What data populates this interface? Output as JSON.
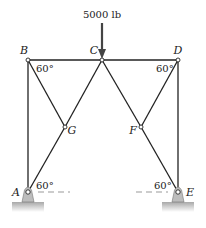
{
  "diagram": {
    "type": "truss",
    "load": {
      "label": "5000 lb",
      "node": "C",
      "direction": "down"
    },
    "nodes": [
      {
        "id": "A",
        "label": "A",
        "x": 28,
        "y": 192,
        "support": "pin"
      },
      {
        "id": "B",
        "label": "B",
        "x": 28,
        "y": 60
      },
      {
        "id": "C",
        "label": "C",
        "x": 102,
        "y": 60
      },
      {
        "id": "D",
        "label": "D",
        "x": 178,
        "y": 60
      },
      {
        "id": "E",
        "label": "E",
        "x": 178,
        "y": 192,
        "support": "pin"
      },
      {
        "id": "F",
        "label": "F",
        "x": 141,
        "y": 127
      },
      {
        "id": "G",
        "label": "G",
        "x": 65,
        "y": 127
      }
    ],
    "members": [
      [
        "A",
        "B"
      ],
      [
        "B",
        "C"
      ],
      [
        "C",
        "D"
      ],
      [
        "D",
        "E"
      ],
      [
        "B",
        "G"
      ],
      [
        "G",
        "C"
      ],
      [
        "A",
        "G"
      ],
      [
        "C",
        "F"
      ],
      [
        "F",
        "D"
      ],
      [
        "F",
        "E"
      ]
    ],
    "angles": [
      {
        "at": "B",
        "label": "60°"
      },
      {
        "at": "D",
        "label": "60°"
      },
      {
        "at": "A",
        "label": "60°"
      },
      {
        "at": "E",
        "label": "60°"
      }
    ],
    "colors": {
      "line": "#222222",
      "support_fill": "#bdbdbd",
      "ground_top": "#a8a8a8",
      "dashed": "#999999"
    }
  }
}
